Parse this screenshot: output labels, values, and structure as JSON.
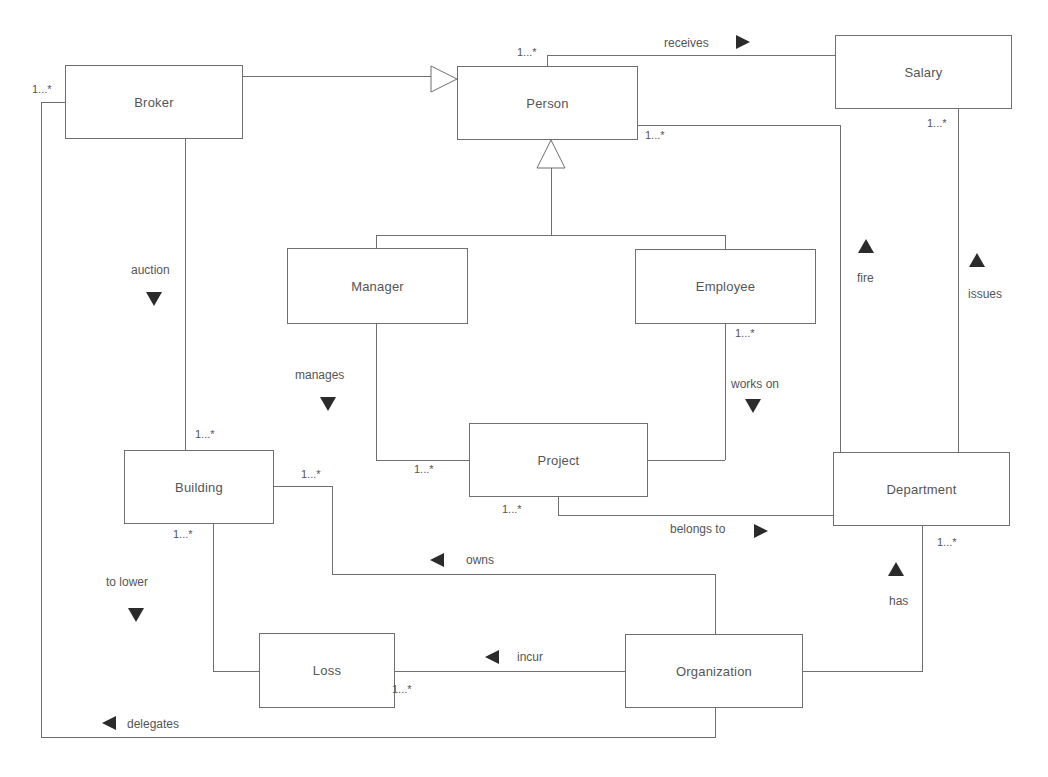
{
  "diagram": {
    "type": "UML class diagram",
    "classes": {
      "broker": "Broker",
      "person": "Person",
      "salary": "Salary",
      "manager": "Manager",
      "employee": "Employee",
      "project": "Project",
      "building": "Building",
      "department": "Department",
      "loss": "Loss",
      "organization": "Organization"
    },
    "associations": {
      "receives": "receives",
      "auction": "auction",
      "fire": "fire",
      "issues": "issues",
      "manages": "manages",
      "works_on": "works on",
      "belongs_to": "belongs to",
      "owns": "owns",
      "to_lower": "to lower",
      "has": "has",
      "incur": "incur",
      "delegates": "delegates"
    },
    "multiplicities": {
      "broker_left": "1...*",
      "person_top": "1...*",
      "person_right": "1...*",
      "salary_bottom": "1...*",
      "employee_bottom": "1...*",
      "building_top": "1...*",
      "building_right": "1...*",
      "building_bottom": "1...*",
      "project_left": "1...*",
      "project_bottom": "1...*",
      "department_bottom": "1...*",
      "organization_left": "1...*"
    },
    "generalizations": [
      {
        "child": "Broker",
        "parent": "Person"
      },
      {
        "child": "Manager",
        "parent": "Person"
      },
      {
        "child": "Employee",
        "parent": "Person"
      }
    ],
    "colors": {
      "line": "#6f6f6f",
      "text": "#555555",
      "arrow": "#2b2b2b",
      "background": "#ffffff"
    }
  }
}
